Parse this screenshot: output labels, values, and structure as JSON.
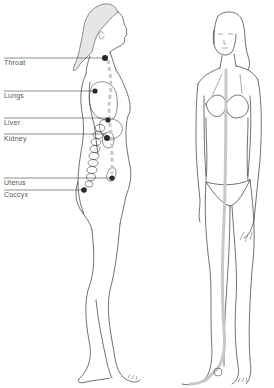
{
  "diagram": {
    "channel_color": "#c8c8c8",
    "point_color": "#2a2a2a",
    "labels": [
      {
        "id": "throat",
        "text": "Throat",
        "x": 4,
        "y": 64
      },
      {
        "id": "lungs",
        "text": "Lungs",
        "x": 4,
        "y": 97
      },
      {
        "id": "liver",
        "text": "Liver",
        "x": 4,
        "y": 122
      },
      {
        "id": "kidney",
        "text": "Kidney",
        "x": 4,
        "y": 138
      },
      {
        "id": "uterus",
        "text": "Uterus",
        "x": 4,
        "y": 178
      },
      {
        "id": "coccyx",
        "text": "Coccyx",
        "x": 4,
        "y": 190
      }
    ]
  }
}
